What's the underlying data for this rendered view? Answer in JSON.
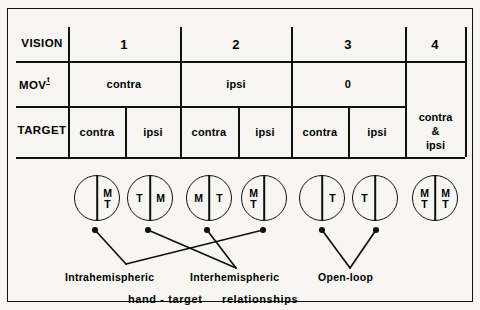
{
  "figure": {
    "top_title": "left hand",
    "rows": [
      {
        "label": "VISION"
      },
      {
        "label_main": "MOV",
        "label_sup": "t"
      },
      {
        "label": "TARGET"
      }
    ],
    "vision_values": [
      "1",
      "2",
      "3",
      "4"
    ],
    "mov_values": [
      "contra",
      "ipsi",
      "0"
    ],
    "col4_value": "contra\n&\nipsi",
    "col4_lines": [
      "contra",
      "&",
      "ipsi"
    ],
    "target_values": [
      "contra",
      "ipsi",
      "contra",
      "ipsi",
      "contra",
      "ipsi"
    ],
    "circles": [
      {
        "id": "c1",
        "left": "",
        "right": "MT"
      },
      {
        "id": "c2",
        "left": "T",
        "right": "M"
      },
      {
        "id": "c3",
        "left": "M",
        "right": "T"
      },
      {
        "id": "c4",
        "left": "MT",
        "right": ""
      },
      {
        "id": "c5",
        "left": "",
        "right": "T"
      },
      {
        "id": "c6",
        "left": "T",
        "right": ""
      },
      {
        "id": "c7",
        "left": "MT",
        "right": "MT"
      }
    ],
    "annotations": [
      {
        "id": "intra",
        "label": "Intrahemispheric"
      },
      {
        "id": "inter",
        "label": "Interhemispheric"
      },
      {
        "id": "open",
        "label": "Open-loop"
      }
    ],
    "caption": "hand - target    relationships",
    "caption_parts": [
      "hand - target",
      "relationships"
    ],
    "colors": {
      "ink": "#111111",
      "paper": "#f7f6f2"
    }
  }
}
